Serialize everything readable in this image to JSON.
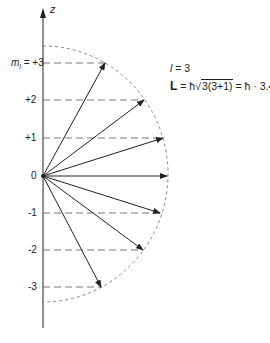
{
  "axis": {
    "label": "z"
  },
  "levels": [
    {
      "label": "m_l = +3",
      "display_prefix": "m",
      "display_sub": "l",
      "display_value": " = +3",
      "ml": 3
    },
    {
      "label": "+2",
      "ml": 2
    },
    {
      "label": "+1",
      "ml": 1
    },
    {
      "label": "0",
      "ml": 0
    },
    {
      "label": "-1",
      "ml": -1
    },
    {
      "label": "-2",
      "ml": -2
    },
    {
      "label": "-3",
      "ml": -3
    }
  ],
  "equations": {
    "l_line": {
      "symbol": "l",
      "rest": " = 3"
    },
    "L_line": {
      "symbol": "L",
      "eq1": " = ħ",
      "sqrt": "3(3+1)",
      "eq2": " = ħ · 3.47"
    }
  },
  "colors": {
    "line": "#222222",
    "dashed": "#555555"
  }
}
